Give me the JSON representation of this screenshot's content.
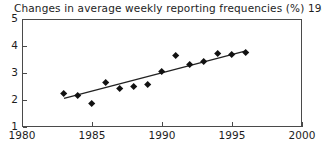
{
  "chart_data": {
    "type": "scatter",
    "title": "Changes in average weekly reporting frequencies (%) 1983-1996",
    "xlabel": "",
    "ylabel": "",
    "xlim": [
      1980,
      2000
    ],
    "ylim": [
      1,
      5
    ],
    "grid": false,
    "legend": null,
    "x_ticks": [
      1980,
      1985,
      1990,
      1995,
      2000
    ],
    "y_ticks": [
      1,
      2,
      3,
      4,
      5
    ],
    "x": [
      1983,
      1984,
      1985,
      1986,
      1987,
      1988,
      1989,
      1990,
      1991,
      1992,
      1993,
      1994,
      1995,
      1996
    ],
    "values": [
      2.25,
      2.15,
      1.88,
      2.63,
      2.42,
      2.5,
      2.57,
      3.05,
      3.65,
      3.3,
      3.42,
      3.72,
      3.68,
      3.77
    ],
    "series": [
      {
        "name": "Average weekly reporting frequency",
        "marker": "diamond",
        "color": "#111111",
        "x": [
          1983,
          1984,
          1985,
          1986,
          1987,
          1988,
          1989,
          1990,
          1991,
          1992,
          1993,
          1994,
          1995,
          1996
        ],
        "values": [
          2.25,
          2.15,
          1.88,
          2.63,
          2.42,
          2.5,
          2.57,
          3.05,
          3.65,
          3.3,
          3.42,
          3.72,
          3.68,
          3.77
        ]
      },
      {
        "name": "Linear trend",
        "type": "line",
        "color": "#222222",
        "x": [
          1983,
          1996
        ],
        "values": [
          2.06,
          3.82
        ]
      }
    ],
    "annotations": []
  },
  "axes": {
    "y_tick_labels": [
      "5",
      "4",
      "3",
      "2",
      "1"
    ],
    "y_tick_values": [
      5,
      4,
      3,
      2,
      1
    ],
    "x_tick_labels": [
      "1980",
      "1985",
      "1990",
      "1995",
      "2000"
    ],
    "x_tick_values": [
      1980,
      1985,
      1990,
      1995,
      2000
    ]
  },
  "colors": {
    "axis": "#4a4a4a",
    "marker": "#111111",
    "trendline": "#222222",
    "text": "#1d1d1d",
    "background": "#ffffff"
  }
}
